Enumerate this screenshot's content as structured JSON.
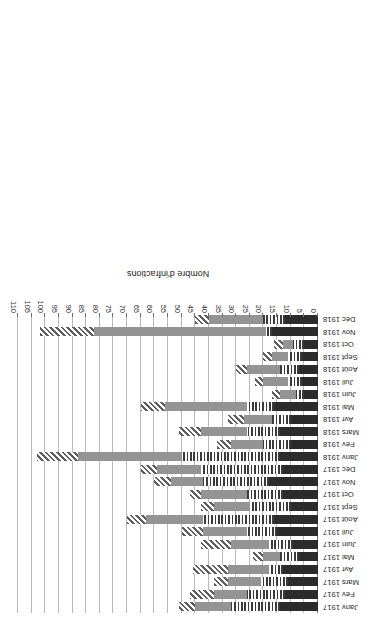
{
  "chart_data": {
    "type": "bar",
    "orientation": "horizontal-stacked",
    "title": "",
    "xlabel": "",
    "ylabel": "Nombre d'infractions",
    "value_axis_label": "Nombre d'infractions",
    "ylim": [
      0,
      110
    ],
    "tick_step": 5,
    "ticks": [
      0,
      5,
      10,
      15,
      20,
      25,
      30,
      35,
      40,
      45,
      50,
      55,
      60,
      65,
      70,
      75,
      80,
      85,
      90,
      95,
      100,
      105,
      110
    ],
    "grid": true,
    "legend_position": "bottom",
    "categories": [
      "Janv 1917",
      "Fév 1917",
      "Mars 1917",
      "Avr 1917",
      "Mai 1917",
      "Juin 1917",
      "Juil 1917",
      "Août 1917",
      "Sept 1917",
      "Oct 1917",
      "Nov 1917",
      "Déc 1917",
      "Janv 1918",
      "Fév 1918",
      "Mars 1918",
      "Avr 1918",
      "Mai 1918",
      "Juin 1918",
      "Juil 1918",
      "Août 1918",
      "Sept 1918",
      "Oct 1918",
      "Nov 1918",
      "Déc 1918"
    ],
    "series": [
      {
        "name": "Infractions, 27e Bon",
        "pattern": "solid-dark",
        "color": "#2b2b2b",
        "values": [
          14,
          12,
          11,
          13,
          7,
          9,
          15,
          16,
          10,
          13,
          18,
          13,
          14,
          10,
          14,
          10,
          16,
          5,
          6,
          7,
          6,
          5,
          17,
          12
        ]
      },
      {
        "name": "Infractions, 28e Bon",
        "pattern": "vertical-stripes",
        "color": "#3a3a3a",
        "values": [
          18,
          14,
          10,
          5,
          7,
          9,
          11,
          26,
          15,
          13,
          24,
          30,
          36,
          10,
          12,
          7,
          10,
          3,
          5,
          7,
          5,
          4,
          2,
          8
        ]
      },
      {
        "name": "Infractions, 29e Bon",
        "pattern": "solid-gray",
        "color": "#949494",
        "values": [
          13,
          12,
          12,
          15,
          6,
          14,
          16,
          21,
          13,
          17,
          12,
          16,
          38,
          12,
          17,
          10,
          30,
          6,
          9,
          12,
          6,
          4,
          63,
          20
        ]
      },
      {
        "name": "Infractions, 31e Bon",
        "pattern": "diagonal-hatch",
        "color": "#5e5e5e",
        "values": [
          6,
          9,
          5,
          13,
          4,
          11,
          8,
          7,
          5,
          4,
          6,
          6,
          15,
          5,
          8,
          6,
          9,
          3,
          3,
          4,
          3,
          3,
          20,
          5
        ]
      }
    ]
  },
  "axis": {
    "value_title": "Nombre d'infractions"
  }
}
